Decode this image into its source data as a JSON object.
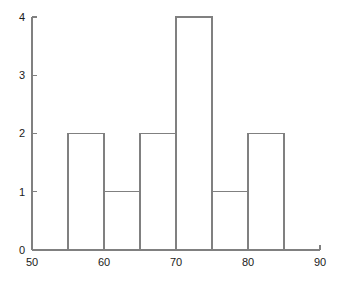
{
  "chart_data": {
    "type": "bar",
    "subtype": "histogram",
    "title": "",
    "xlabel": "",
    "ylabel": "",
    "xlim": [
      50,
      90
    ],
    "ylim": [
      0,
      4
    ],
    "xticks": [
      50,
      60,
      70,
      80,
      90
    ],
    "xtick_labels": [
      "50",
      "60",
      "70",
      "80",
      "90"
    ],
    "yticks": [
      0,
      1,
      2,
      3,
      4
    ],
    "ytick_labels": [
      "0",
      "1",
      "2",
      "3",
      "4"
    ],
    "grid": false,
    "legend": false,
    "bin_width": 5,
    "bin_edges": [
      55,
      60,
      65,
      70,
      75,
      80,
      85
    ],
    "categories": [
      "55-60",
      "60-65",
      "65-70",
      "70-75",
      "75-80",
      "80-85"
    ],
    "values": [
      2,
      1,
      2,
      4,
      1,
      2
    ],
    "bars": [
      {
        "x0": 55,
        "x1": 60,
        "count": 2
      },
      {
        "x0": 60,
        "x1": 65,
        "count": 1
      },
      {
        "x0": 65,
        "x1": 70,
        "count": 2
      },
      {
        "x0": 70,
        "x1": 75,
        "count": 4
      },
      {
        "x0": 75,
        "x1": 80,
        "count": 1
      },
      {
        "x0": 80,
        "x1": 85,
        "count": 2
      }
    ],
    "colors": {
      "bar_edge": "#808080",
      "bar_fill": "none",
      "axis": "#808080",
      "tick_label": "#1a1a1a",
      "background": "#ffffff"
    }
  },
  "axes": {
    "x_axis_name": "x-axis",
    "y_axis_name": "y-axis"
  }
}
